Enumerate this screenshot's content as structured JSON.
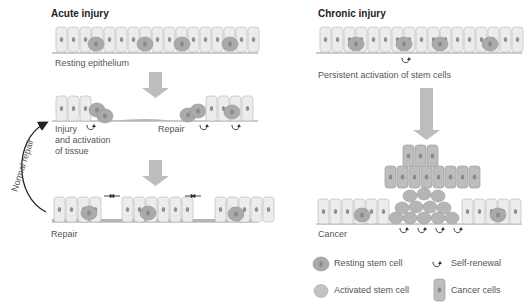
{
  "colors": {
    "cell_fill": "#ececec",
    "cell_stroke": "#bdbdbd",
    "nucleus": "#8a8a8a",
    "stem_cell": "#a9a9a9",
    "cancer_cell": "#bcbcbc",
    "arrow_gray": "#bdbdbd",
    "baseline": "#9a9a9a",
    "text": "#555555",
    "title": "#222222"
  },
  "acute": {
    "title": "Acute injury",
    "stage1_label": "Resting epithelium",
    "stage2_label_injury": "Injury\nand activation\nof tissue",
    "stage2_label_injury_lines": [
      "Injury",
      "and activation",
      "of tissue"
    ],
    "stage2_label_repair": "Repair",
    "stage3_label": "Repair",
    "loop_label": "Normal repair"
  },
  "chronic": {
    "title": "Chronic injury",
    "stage1_label": "Persistent activation of stem cells",
    "stage2_label": "Cancer"
  },
  "legend": {
    "items": [
      {
        "icon": "resting-stem-cell-icon",
        "label": "Resting stem cell"
      },
      {
        "icon": "self-renewal-icon",
        "label": "Self-renewal"
      },
      {
        "icon": "activated-stem-cell-icon",
        "label": "Activated stem cell"
      },
      {
        "icon": "cancer-cell-icon",
        "label": "Cancer cells"
      }
    ]
  }
}
